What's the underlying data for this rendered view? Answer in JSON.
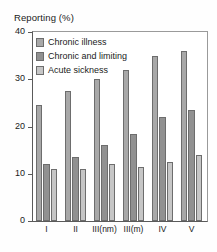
{
  "chart_data": {
    "type": "bar",
    "title": "Reporting (%)",
    "xlabel": "",
    "ylabel": "Reporting (%)",
    "categories": [
      "I",
      "II",
      "III(nm)",
      "III(m)",
      "IV",
      "V"
    ],
    "series": [
      {
        "name": "Chronic illness",
        "color": "#a8a8a8",
        "values": [
          24.5,
          27.5,
          30.0,
          32.0,
          35.0,
          36.0
        ]
      },
      {
        "name": "Chronic and limiting",
        "color": "#919191",
        "values": [
          12.0,
          13.5,
          16.0,
          18.5,
          22.0,
          23.5
        ]
      },
      {
        "name": "Acute sickness",
        "color": "#c6c6c6",
        "values": [
          11.0,
          11.0,
          12.0,
          11.5,
          12.5,
          14.0
        ]
      }
    ],
    "ylim": [
      0,
      40
    ],
    "yticks": [
      0,
      10,
      20,
      30,
      40
    ],
    "ytick_labels": [
      "0",
      "10",
      "20",
      "30",
      "40"
    ],
    "grid": false,
    "legend_position": "top-left"
  }
}
